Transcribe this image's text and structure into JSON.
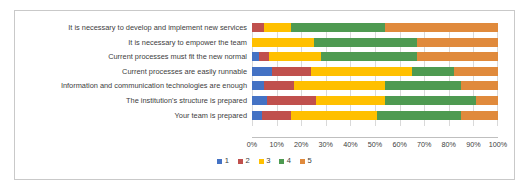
{
  "chart_data": {
    "type": "bar",
    "orientation": "horizontal",
    "stacked": true,
    "stack_mode": "percent",
    "title": "",
    "xlabel": "",
    "ylabel": "",
    "xlim": [
      0,
      100
    ],
    "grid": true,
    "legend_position": "bottom",
    "xticks": [
      "0%",
      "10%",
      "20%",
      "30%",
      "40%",
      "50%",
      "60%",
      "70%",
      "80%",
      "90%",
      "100%"
    ],
    "xtick_values": [
      0,
      10,
      20,
      30,
      40,
      50,
      60,
      70,
      80,
      90,
      100
    ],
    "categories": [
      "It is necessary to develop and implement new services",
      "It is necessary to empower the team",
      "Current processes must fit the new normal",
      "Current processes are easily runnable",
      "Information and communication technologies are enough",
      "The institution's structure is prepared",
      "Your team is prepared"
    ],
    "series": [
      {
        "name": "1",
        "color": "#4472C4",
        "values": [
          0,
          0,
          3,
          8,
          5,
          6,
          4
        ]
      },
      {
        "name": "2",
        "color": "#C0504D",
        "values": [
          5,
          0,
          4,
          16,
          12,
          20,
          12
        ]
      },
      {
        "name": "3",
        "color": "#FFC000",
        "values": [
          11,
          25,
          21,
          41,
          37,
          28,
          35
        ]
      },
      {
        "name": "4",
        "color": "#4E9A51",
        "values": [
          38,
          42,
          39,
          17,
          31,
          37,
          34
        ]
      },
      {
        "name": "5",
        "color": "#E08A3C",
        "values": [
          46,
          33,
          33,
          18,
          15,
          9,
          15
        ]
      }
    ],
    "legend": [
      {
        "label": "1",
        "color": "#4472C4"
      },
      {
        "label": "2",
        "color": "#C0504D"
      },
      {
        "label": "3",
        "color": "#FFC000"
      },
      {
        "label": "4",
        "color": "#4E9A51"
      },
      {
        "label": "5",
        "color": "#E08A3C"
      }
    ]
  }
}
